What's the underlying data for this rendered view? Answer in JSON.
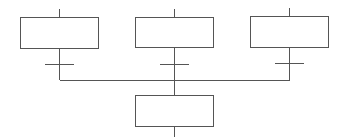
{
  "diagram": {
    "type": "grafcet-convergence",
    "colors": {
      "line": "#555555",
      "background": "#ffffff"
    },
    "steps": [
      {
        "id": "step-left",
        "label": "",
        "x": 20,
        "y": 17,
        "w": 78,
        "h": 32
      },
      {
        "id": "step-middle",
        "label": "",
        "x": 135,
        "y": 17,
        "w": 78,
        "h": 31
      },
      {
        "id": "step-right",
        "label": "",
        "x": 250,
        "y": 16,
        "w": 78,
        "h": 32
      },
      {
        "id": "step-bottom",
        "label": "",
        "x": 135,
        "y": 95,
        "w": 78,
        "h": 32
      }
    ],
    "transitions": [
      {
        "id": "transition-left",
        "label": "",
        "x1": 45,
        "x2": 74,
        "y": 64
      },
      {
        "id": "transition-middle",
        "label": "",
        "x1": 160,
        "x2": 189,
        "y": 64
      },
      {
        "id": "transition-right",
        "label": "",
        "x1": 275,
        "x2": 304,
        "y": 63
      }
    ],
    "junction": {
      "y": 80,
      "x1": 59,
      "x2": 289
    }
  }
}
